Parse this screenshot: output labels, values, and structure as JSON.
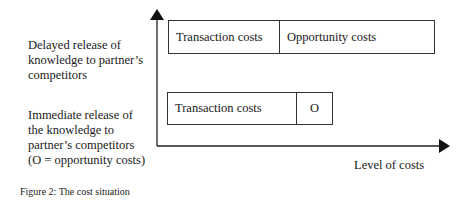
{
  "rows": [
    {
      "label": [
        "Delayed release of",
        "knowledge to partner’s",
        "competitors"
      ],
      "segments": [
        "Transaction costs",
        "Opportunity costs"
      ]
    },
    {
      "label": [
        "Immediate release of",
        "the knowledge to",
        "partner’s competitors",
        "(O = opportunity costs)"
      ],
      "segments": [
        "Transaction costs",
        "O"
      ]
    }
  ],
  "axes": {
    "x_label": "Level of costs"
  },
  "caption": "Figure 2: The cost situation"
}
